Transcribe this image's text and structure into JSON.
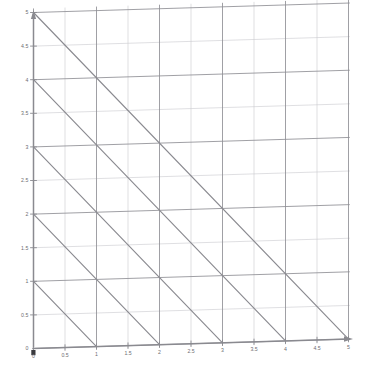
{
  "figure": {
    "kind": "coordinate-grid-graph",
    "background_color": "#ffffff",
    "width": 372,
    "height": 379
  },
  "axes": {
    "x_axis": {
      "name": "x-axis",
      "arrow": "right",
      "color": "#8a8a90",
      "min": 0,
      "max": 5
    },
    "y_axis": {
      "name": "y-axis",
      "arrow": "up",
      "color": "#8a8a90",
      "min": 0,
      "max": 5
    }
  },
  "grid": {
    "major_color": "#8f8f95",
    "minor_color": "#c9c9cf",
    "major_step": 1,
    "minor_step": 0.5,
    "show": true
  },
  "x_ticks": [
    {
      "value": 0,
      "label": "0"
    },
    {
      "value": 0.5,
      "label": "0.5"
    },
    {
      "value": 1,
      "label": "1"
    },
    {
      "value": 1.5,
      "label": "1.5"
    },
    {
      "value": 2,
      "label": "2"
    },
    {
      "value": 2.5,
      "label": "2.5"
    },
    {
      "value": 3,
      "label": "3"
    },
    {
      "value": 3.5,
      "label": "3.5"
    },
    {
      "value": 4,
      "label": "4"
    },
    {
      "value": 4.5,
      "label": "4.5"
    },
    {
      "value": 5,
      "label": "5"
    }
  ],
  "y_ticks": [
    {
      "value": 0,
      "label": "0"
    },
    {
      "value": 0.5,
      "label": "0.5"
    },
    {
      "value": 1,
      "label": "1"
    },
    {
      "value": 1.5,
      "label": "1.5"
    },
    {
      "value": 2,
      "label": "2"
    },
    {
      "value": 2.5,
      "label": "2.5"
    },
    {
      "value": 3,
      "label": "3"
    },
    {
      "value": 3.5,
      "label": "3.5"
    },
    {
      "value": 4,
      "label": "4"
    },
    {
      "value": 4.5,
      "label": "4.5"
    },
    {
      "value": 5,
      "label": "5"
    }
  ],
  "chart_data": {
    "type": "line",
    "title": "",
    "xlabel": "",
    "ylabel": "",
    "xlim": [
      0,
      5
    ],
    "ylim": [
      0,
      5
    ],
    "grid": true,
    "legend": "none",
    "line_color": "#8a8a90",
    "series": [
      {
        "name": "x + y = 1",
        "c": 1,
        "slope": -1,
        "intercept": 1,
        "x": [
          0,
          1
        ],
        "y": [
          1,
          0
        ]
      },
      {
        "name": "x + y = 2",
        "c": 2,
        "slope": -1,
        "intercept": 2,
        "x": [
          0,
          2
        ],
        "y": [
          2,
          0
        ]
      },
      {
        "name": "x + y = 3",
        "c": 3,
        "slope": -1,
        "intercept": 3,
        "x": [
          0,
          3
        ],
        "y": [
          3,
          0
        ]
      },
      {
        "name": "x + y = 4",
        "c": 4,
        "slope": -1,
        "intercept": 4,
        "x": [
          0,
          4
        ],
        "y": [
          4,
          0
        ]
      },
      {
        "name": "x + y = 5",
        "c": 5,
        "slope": -1,
        "intercept": 5,
        "x": [
          0,
          5
        ],
        "y": [
          5,
          0
        ]
      }
    ]
  }
}
